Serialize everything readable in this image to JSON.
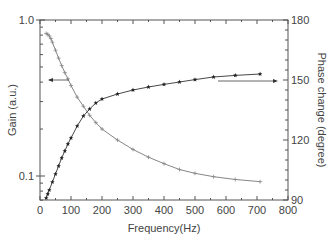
{
  "chart_data": {
    "type": "line",
    "title": "",
    "xlabel": "Frequency(Hz)",
    "ylabel": "Gain (a.u.)",
    "y2label": "Phase change (degree)",
    "xlim": [
      0,
      800
    ],
    "ylim": [
      0.06,
      1.0
    ],
    "yscale": "log",
    "y2lim": [
      90,
      180
    ],
    "xticks": [
      "0",
      "100",
      "200",
      "300",
      "400",
      "500",
      "600",
      "700",
      "800"
    ],
    "yticks": [
      "0.1",
      "1.0"
    ],
    "y2ticks": [
      "90",
      "120",
      "150",
      "180"
    ],
    "grid": false,
    "legend": null,
    "annotations": [
      {
        "type": "arrow",
        "direction": "left",
        "target_axis": "left",
        "series": "Gain"
      },
      {
        "type": "arrow",
        "direction": "right",
        "target_axis": "right",
        "series": "Phase change"
      }
    ],
    "series": [
      {
        "name": "Gain",
        "axis": "left",
        "marker": "open-cross",
        "x": [
          20,
          25,
          30,
          35,
          40,
          50,
          60,
          70,
          80,
          90,
          100,
          120,
          140,
          160,
          180,
          200,
          250,
          300,
          350,
          400,
          450,
          500,
          560,
          630,
          710
        ],
        "y": [
          0.82,
          0.81,
          0.79,
          0.76,
          0.72,
          0.64,
          0.57,
          0.51,
          0.46,
          0.42,
          0.38,
          0.32,
          0.28,
          0.245,
          0.22,
          0.2,
          0.17,
          0.148,
          0.132,
          0.12,
          0.11,
          0.104,
          0.099,
          0.095,
          0.092
        ]
      },
      {
        "name": "Phase change",
        "axis": "right",
        "marker": "filled-star",
        "x": [
          20,
          25,
          30,
          40,
          50,
          60,
          70,
          80,
          90,
          100,
          120,
          140,
          160,
          180,
          200,
          250,
          300,
          350,
          400,
          450,
          500,
          560,
          630,
          710
        ],
        "y": [
          91,
          93,
          95,
          99,
          103,
          107,
          111,
          114.5,
          118,
          121,
          127,
          132,
          135.5,
          138.5,
          140.5,
          143,
          145,
          146.5,
          147.8,
          149,
          150.2,
          151.5,
          152.3,
          153
        ]
      }
    ]
  }
}
